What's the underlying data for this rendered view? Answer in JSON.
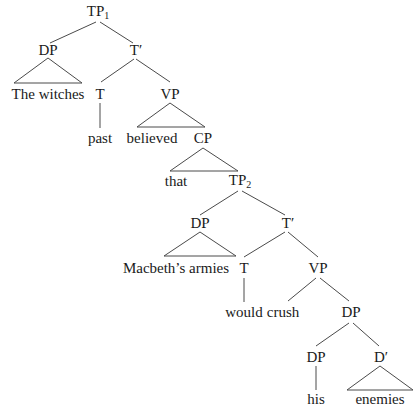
{
  "diagram": {
    "type": "syntax-tree",
    "sentence": "The witches believed that Macbeth's armies would crush his enemies",
    "nodes": {
      "tp1": {
        "label": "TP",
        "sub": "1"
      },
      "dp_subj": {
        "label": "DP"
      },
      "tbar1": {
        "label": "T′"
      },
      "the_witches": {
        "label": "The witches"
      },
      "t1": {
        "label": "T"
      },
      "vp1": {
        "label": "VP"
      },
      "past": {
        "label": "past"
      },
      "believed": {
        "label": "believed"
      },
      "cp": {
        "label": "CP"
      },
      "that": {
        "label": "that"
      },
      "tp2": {
        "label": "TP",
        "sub": "2"
      },
      "dp_macbeth": {
        "label": "DP"
      },
      "tbar2": {
        "label": "T′"
      },
      "macbeths_armies": {
        "label": "Macbeth’s armies"
      },
      "t2": {
        "label": "T"
      },
      "vp2": {
        "label": "VP"
      },
      "would": {
        "label": "would"
      },
      "crush": {
        "label": "crush"
      },
      "dp_obj": {
        "label": "DP"
      },
      "dp_his": {
        "label": "DP"
      },
      "dbar": {
        "label": "D′"
      },
      "his": {
        "label": "his"
      },
      "enemies": {
        "label": "enemies"
      }
    },
    "edges": [
      [
        "tp1",
        "dp_subj"
      ],
      [
        "tp1",
        "tbar1"
      ],
      [
        "dp_subj",
        "the_witches",
        "triangle"
      ],
      [
        "tbar1",
        "t1"
      ],
      [
        "tbar1",
        "vp1"
      ],
      [
        "t1",
        "past"
      ],
      [
        "vp1",
        "believed"
      ],
      [
        "vp1",
        "cp"
      ],
      [
        "cp",
        "that"
      ],
      [
        "cp",
        "tp2"
      ],
      [
        "tp2",
        "dp_macbeth"
      ],
      [
        "tp2",
        "tbar2"
      ],
      [
        "dp_macbeth",
        "macbeths_armies",
        "triangle"
      ],
      [
        "tbar2",
        "t2"
      ],
      [
        "tbar2",
        "vp2"
      ],
      [
        "t2",
        "would"
      ],
      [
        "vp2",
        "crush"
      ],
      [
        "vp2",
        "dp_obj"
      ],
      [
        "dp_obj",
        "dp_his"
      ],
      [
        "dp_obj",
        "dbar"
      ],
      [
        "dp_his",
        "his"
      ],
      [
        "dbar",
        "enemies",
        "triangle"
      ]
    ]
  }
}
